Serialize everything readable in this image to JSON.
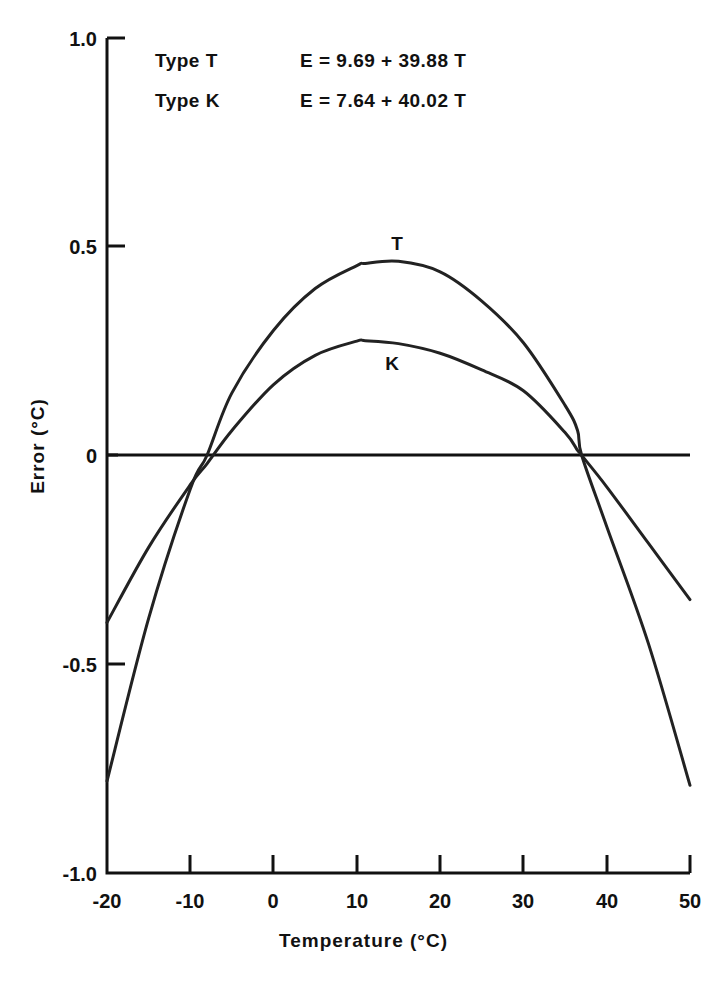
{
  "legend": {
    "type_t_label": "Type T",
    "type_t_equation": "E = 9.69 + 39.88 T",
    "type_k_label": "Type K",
    "type_k_equation": "E = 7.64 + 40.02 T"
  },
  "axes": {
    "x_title": "Temperature   (°C)",
    "y_title": "Error  (°C)"
  },
  "labels": {
    "curve_t": "T",
    "curve_k": "K"
  },
  "ticks": {
    "x": [
      "-20",
      "-10",
      "0",
      "10",
      "20",
      "30",
      "40",
      "50"
    ],
    "y": [
      "1.0",
      "0.5",
      "0",
      "-0.5",
      "-1.0"
    ]
  },
  "chart_data": {
    "type": "line",
    "title": "",
    "xlabel": "Temperature   (°C)",
    "ylabel": "Error  (°C)",
    "xlim": [
      -20,
      50
    ],
    "ylim": [
      -1.0,
      1.0
    ],
    "xticks": [
      -20,
      -10,
      0,
      10,
      20,
      30,
      40,
      50
    ],
    "yticks": [
      -1.0,
      -0.5,
      0,
      0.5,
      1.0
    ],
    "grid": false,
    "legend_position": "top-left-annotation",
    "annotations": [
      {
        "text": "Type T",
        "equation": "E = 9.69 + 39.88 T"
      },
      {
        "text": "Type K",
        "equation": "E = 7.64 + 40.02 T"
      }
    ],
    "x": [
      -20,
      -15,
      -10,
      -8,
      -5,
      0,
      5,
      10,
      11,
      15,
      20,
      25,
      30,
      35,
      36.5,
      37,
      40,
      45,
      50
    ],
    "series": [
      {
        "name": "T",
        "label": "T",
        "peak": {
          "x": 15,
          "y": 0.465
        },
        "zero_crossings": [
          -8,
          37
        ],
        "values": [
          -0.78,
          -0.39,
          -0.08,
          0.0,
          0.15,
          0.3,
          0.4,
          0.455,
          0.46,
          0.465,
          0.44,
          0.37,
          0.27,
          0.12,
          0.06,
          0.0,
          -0.17,
          -0.45,
          -0.79
        ]
      },
      {
        "name": "K",
        "label": "K",
        "peak": {
          "x": 11,
          "y": 0.275
        },
        "zero_crossings": [
          -6,
          36.5
        ],
        "values": [
          -0.4,
          -0.22,
          -0.07,
          -0.02,
          0.06,
          0.17,
          0.24,
          0.274,
          0.275,
          0.268,
          0.245,
          0.205,
          0.155,
          0.055,
          0.012,
          0.0,
          -0.075,
          -0.21,
          -0.345
        ]
      }
    ]
  }
}
